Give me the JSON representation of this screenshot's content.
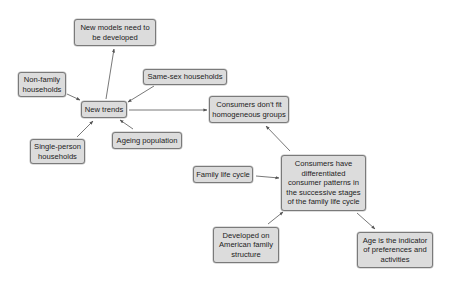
{
  "diagram": {
    "type": "concept-map",
    "colors": {
      "box_fill": "#dcdcdc",
      "box_border": "#7a7a7a",
      "arrow": "#555555",
      "text": "#222222"
    },
    "nodes": [
      {
        "id": "new-models",
        "label": "New models need to be developed",
        "lines": [
          "New models need to",
          "be developed"
        ]
      },
      {
        "id": "non-family",
        "label": "Non-family households",
        "lines": [
          "Non-family",
          "households"
        ]
      },
      {
        "id": "new-trends",
        "label": "New trends",
        "lines": [
          "New trends"
        ]
      },
      {
        "id": "same-sex",
        "label": "Same-sex households",
        "lines": [
          "Same-sex households"
        ]
      },
      {
        "id": "consumers-dont-fit",
        "label": "Consumers don't fit homogeneous groups",
        "lines": [
          "Consumers don’t fit",
          "homogeneous groups"
        ]
      },
      {
        "id": "single-person",
        "label": "Single-person households",
        "lines": [
          "Single-person",
          "households"
        ]
      },
      {
        "id": "ageing",
        "label": "Ageing population",
        "lines": [
          "Ageing population"
        ]
      },
      {
        "id": "family-life-cycle",
        "label": "Family life cycle",
        "lines": [
          "Family life cycle"
        ]
      },
      {
        "id": "differentiated",
        "label": "Consumers have differentiated consumer patterns in the successive stages of the family life cycle",
        "lines": [
          "Consumers have",
          "differentiated",
          "consumer patterns in",
          "the successive stages",
          "of the family life cycle"
        ]
      },
      {
        "id": "american",
        "label": "Developed on American family structure",
        "lines": [
          "Developed on",
          "American family",
          "structure"
        ]
      },
      {
        "id": "age-indicator",
        "label": "Age is the indicator of preferences and activities",
        "lines": [
          "Age is the indicator",
          "of preferences and",
          "activities"
        ]
      }
    ],
    "edges": [
      {
        "from": "new-trends",
        "to": "new-models"
      },
      {
        "from": "non-family",
        "to": "new-trends"
      },
      {
        "from": "same-sex",
        "to": "new-trends"
      },
      {
        "from": "single-person",
        "to": "new-trends"
      },
      {
        "from": "ageing",
        "to": "new-trends"
      },
      {
        "from": "new-trends",
        "to": "consumers-dont-fit"
      },
      {
        "from": "differentiated",
        "to": "consumers-dont-fit"
      },
      {
        "from": "family-life-cycle",
        "to": "differentiated"
      },
      {
        "from": "american",
        "to": "differentiated"
      },
      {
        "from": "differentiated",
        "to": "age-indicator"
      }
    ]
  }
}
